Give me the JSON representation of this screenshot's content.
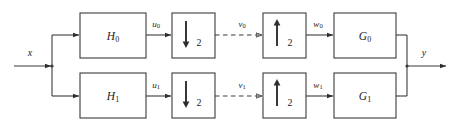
{
  "figure": {
    "kind": "block-diagram",
    "width": 462,
    "height": 130,
    "background_color": "#ffffff",
    "line_color": "#3b3b3b"
  },
  "io": {
    "input_label": "x",
    "output_label": "y"
  },
  "branches": [
    {
      "id": "branch-0",
      "analysis_filter": {
        "base": "H",
        "sub": "0"
      },
      "analysis_output": {
        "base": "u",
        "sub": "0"
      },
      "downsampler": {
        "arrow": "down",
        "factor": "2"
      },
      "subband_signal": {
        "base": "v",
        "sub": "0"
      },
      "upsampler": {
        "arrow": "up",
        "factor": "2"
      },
      "upsampler_output": {
        "base": "w",
        "sub": "0"
      },
      "synthesis_filter": {
        "base": "G",
        "sub": "0"
      }
    },
    {
      "id": "branch-1",
      "analysis_filter": {
        "base": "H",
        "sub": "1"
      },
      "analysis_output": {
        "base": "u",
        "sub": "1"
      },
      "downsampler": {
        "arrow": "down",
        "factor": "2"
      },
      "subband_signal": {
        "base": "v",
        "sub": "1"
      },
      "upsampler": {
        "arrow": "up",
        "factor": "2"
      },
      "upsampler_output": {
        "base": "w",
        "sub": "1"
      },
      "synthesis_filter": {
        "base": "G",
        "sub": "1"
      }
    }
  ]
}
